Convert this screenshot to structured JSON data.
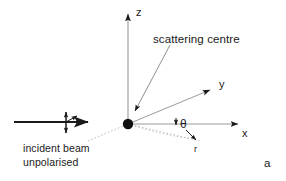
{
  "figure": {
    "caption_label": "a",
    "background_color": "#ffffff",
    "ink_color": "#1a1a1a",
    "faint_color": "#b9b9b9"
  },
  "axes": [
    {
      "name": "z",
      "label": "z",
      "label_x": 137,
      "label_y": 6,
      "tip_x": 128,
      "tip_y": 10,
      "origin_x": 128,
      "origin_y": 124
    },
    {
      "name": "y",
      "label": "y",
      "label_x": 220,
      "label_y": 79,
      "tip_x": 214,
      "tip_y": 88,
      "origin_x": 128,
      "origin_y": 124
    },
    {
      "name": "x",
      "label": "x",
      "label_x": 242,
      "label_y": 128,
      "tip_x": 243,
      "tip_y": 124,
      "origin_x": 128,
      "origin_y": 124
    }
  ],
  "annotations": {
    "scattering_centre": {
      "label": "scattering centre",
      "x": 153,
      "y": 34
    },
    "incident_beam": {
      "line1": "incident beam",
      "line2": "unpolarised",
      "x": 23,
      "y": 143
    },
    "theta": {
      "label": "θ",
      "x": 180,
      "y": 119
    },
    "r_vector": {
      "label": "r",
      "x": 194,
      "y": 146
    }
  },
  "elements": {
    "scattering_centre_dot": {
      "cx": 128,
      "cy": 124,
      "r": 5.2
    },
    "incident_beam_arrow": {
      "x1": 14,
      "y1": 122,
      "x2": 92,
      "y2": 122
    },
    "polarisation_marker": {
      "cx": 66,
      "cy": 122
    },
    "leader_line": {
      "x1": 168,
      "y1": 46,
      "x2": 134,
      "y2": 114
    },
    "r_ray": {
      "x1": 128,
      "y1": 124,
      "x2": 198,
      "y2": 140
    },
    "beam_continuation": {
      "x1": 92,
      "y1": 138,
      "x2": 128,
      "y2": 124
    }
  }
}
